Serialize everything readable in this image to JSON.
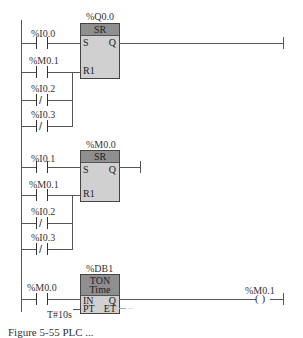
{
  "diagram_type": "ladder-logic",
  "networks": [
    {
      "block": {
        "name": "%Q0.0",
        "type": "SR",
        "pins": {
          "set": "S",
          "reset": "R1",
          "out": "Q"
        }
      },
      "contacts": [
        {
          "label": "%I0.0",
          "kind": "NO",
          "wired_to": "S"
        },
        {
          "label": "%M0.1",
          "kind": "NO",
          "wired_to": "R1"
        },
        {
          "label": "%I0.2",
          "kind": "NC",
          "wired_to": "R1"
        },
        {
          "label": "%I0.3",
          "kind": "NC",
          "wired_to": "R1"
        }
      ]
    },
    {
      "block": {
        "name": "%M0.0",
        "type": "SR",
        "pins": {
          "set": "S",
          "reset": "R1",
          "out": "Q"
        }
      },
      "contacts": [
        {
          "label": "%I0.1",
          "kind": "NO",
          "wired_to": "S"
        },
        {
          "label": "%M0.1",
          "kind": "NO",
          "wired_to": "R1"
        },
        {
          "label": "%I0.2",
          "kind": "NC",
          "wired_to": "R1"
        },
        {
          "label": "%I0.3",
          "kind": "NC",
          "wired_to": "R1"
        }
      ]
    },
    {
      "block": {
        "name": "%DB1",
        "type": "TON",
        "subtype": "Time",
        "pins": {
          "in": "IN",
          "pt": "PT",
          "q": "Q",
          "et": "ET"
        },
        "pt_value": "T#10s",
        "et_value": "..."
      },
      "contacts": [
        {
          "label": "%M0.0",
          "kind": "NO",
          "wired_to": "IN"
        }
      ],
      "coil": {
        "label": "%M0.1",
        "symbol": "( )"
      }
    }
  ],
  "caption": "Figure 5-55  PLC ..."
}
